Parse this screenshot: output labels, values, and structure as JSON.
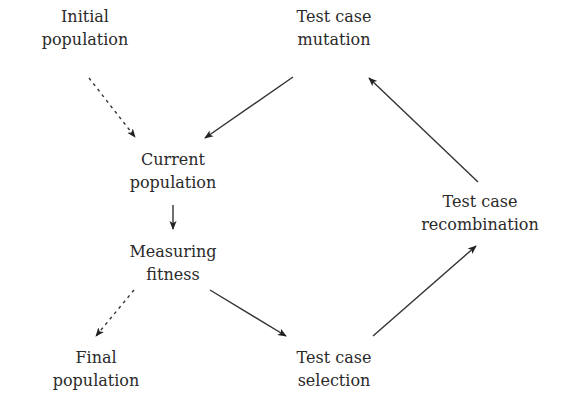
{
  "diagram": {
    "type": "flowchart",
    "nodes": [
      {
        "id": "initial",
        "line1": "Initial",
        "line2": "population",
        "cx": 85,
        "top": 5
      },
      {
        "id": "mutation",
        "line1": "Test case",
        "line2": "mutation",
        "cx": 334,
        "top": 5
      },
      {
        "id": "current",
        "line1": "Current",
        "line2": "population",
        "cx": 173,
        "top": 148
      },
      {
        "id": "recombination",
        "line1": "Test case",
        "line2": "recombination",
        "cx": 480,
        "top": 190
      },
      {
        "id": "fitness",
        "line1": "Measuring",
        "line2": "fitness",
        "cx": 173,
        "top": 240
      },
      {
        "id": "final",
        "line1": "Final",
        "line2": "population",
        "cx": 96,
        "top": 346
      },
      {
        "id": "selection",
        "line1": "Test case",
        "line2": "selection",
        "cx": 334,
        "top": 346
      }
    ],
    "edges": [
      {
        "from": "initial",
        "to": "current",
        "style": "dashed",
        "x1": 89,
        "y1": 78,
        "x2": 135,
        "y2": 137
      },
      {
        "from": "mutation",
        "to": "current",
        "style": "solid",
        "x1": 293,
        "y1": 77,
        "x2": 205,
        "y2": 138
      },
      {
        "from": "current",
        "to": "fitness",
        "style": "solid",
        "x1": 173,
        "y1": 205,
        "x2": 173,
        "y2": 229
      },
      {
        "from": "fitness",
        "to": "final",
        "style": "dashed",
        "x1": 134,
        "y1": 290,
        "x2": 96,
        "y2": 336
      },
      {
        "from": "fitness",
        "to": "selection",
        "style": "solid",
        "x1": 210,
        "y1": 290,
        "x2": 286,
        "y2": 336
      },
      {
        "from": "selection",
        "to": "recombination",
        "style": "solid",
        "x1": 373,
        "y1": 336,
        "x2": 476,
        "y2": 246
      },
      {
        "from": "recombination",
        "to": "mutation",
        "style": "solid",
        "x1": 478,
        "y1": 182,
        "x2": 369,
        "y2": 78
      }
    ],
    "colors": {
      "text": "#2a2a2a",
      "line": "#333333",
      "background": "#ffffff"
    }
  }
}
